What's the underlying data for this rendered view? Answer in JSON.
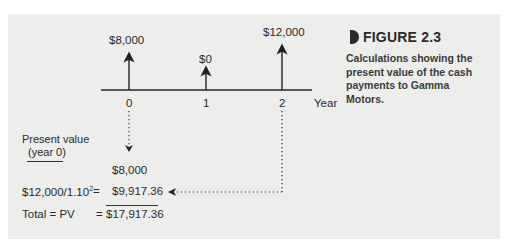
{
  "figure": {
    "label": "FIGURE 2.3",
    "caption": "Calculations showing the present value of the cash payments to Gamma Motors.",
    "accent_color": "#2b2b2b"
  },
  "timeline": {
    "axis_label": "Year",
    "points": [
      {
        "year": "0",
        "cash_flow": "$8,000"
      },
      {
        "year": "1",
        "cash_flow": "$0"
      },
      {
        "year": "2",
        "cash_flow": "$12,000"
      }
    ]
  },
  "calculation": {
    "heading_line1": "Present value",
    "heading_line2": "(year 0)",
    "row1_value": "$8,000",
    "row2_formula": "$12,000/1.10",
    "row2_exponent": "2",
    "row2_equals": "=",
    "row2_value": "$9,917.36",
    "total_label": "Total = PV",
    "total_equals": "=",
    "total_value": "$17,917.36"
  }
}
